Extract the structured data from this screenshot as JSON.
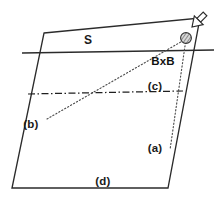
{
  "figure": {
    "type": "technical-line-diagram",
    "background_color": "#ffffff",
    "stroke_color": "#2b2b2b",
    "dotted_color": "#555555",
    "text_color": "#1a1a1a",
    "width": 219,
    "height": 198
  },
  "labels": {
    "surface": "S",
    "field": "BxB",
    "region_a": "(a)",
    "region_b": "(b)",
    "region_c": "(c)",
    "region_d": "(d)"
  },
  "geometry": {
    "slab": {
      "name": "parallelogram-slab",
      "points": "44,33 200,18 168,188 12,188"
    },
    "surface_line": {
      "name": "surface-line-S",
      "x1": 22,
      "y1": 53,
      "x2": 214,
      "y2": 50
    },
    "dashdot_line": {
      "name": "dash-dot-interface-line",
      "x1": 28,
      "y1": 94,
      "x2": 183,
      "y2": 91
    },
    "ray_b": {
      "name": "dotted-ray-b",
      "x1": 47,
      "y1": 119,
      "x2": 186,
      "y2": 39
    },
    "ray_a": {
      "name": "dotted-ray-a",
      "x1": 186,
      "y1": 39,
      "x2": 170,
      "y2": 150
    },
    "sphere": {
      "name": "hatched-sphere-particle",
      "cx": 186,
      "cy": 38,
      "r": 5.4
    },
    "arrow": {
      "name": "incoming-direction-arrow",
      "shaft": "205,14 192,27",
      "head": "190,29 199,27 193,21"
    }
  },
  "label_positions": {
    "surface": {
      "x": 88,
      "y": 44
    },
    "field": {
      "x": 163,
      "y": 65
    },
    "region_a": {
      "x": 155,
      "y": 152
    },
    "region_b": {
      "x": 31,
      "y": 128
    },
    "region_c": {
      "x": 155,
      "y": 90
    },
    "region_d": {
      "x": 103,
      "y": 185
    }
  }
}
